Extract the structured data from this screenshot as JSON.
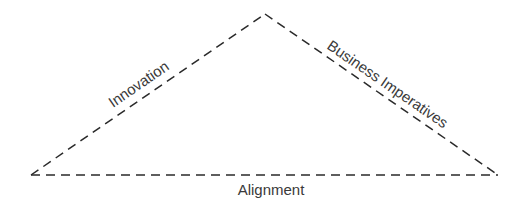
{
  "diagram": {
    "type": "triangle",
    "line_style": "dashed",
    "line_color": "#2a2a2a",
    "edges": {
      "left": "Innovation",
      "right": "Business Imperatives",
      "bottom": "Alignment"
    }
  }
}
